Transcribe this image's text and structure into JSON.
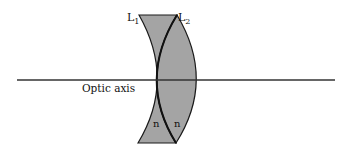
{
  "diagram": {
    "type": "optics-lens-pair",
    "lenses": [
      {
        "id": "L1",
        "label": "L",
        "subscript": "1",
        "index_label": "n"
      },
      {
        "id": "L2",
        "label": "L",
        "subscript": "2",
        "index_label": "n"
      }
    ],
    "axis_label": "Optic axis",
    "colors": {
      "lens_fill": "#a4a4a4",
      "stroke": "#1a1a1a",
      "axis": "#333333"
    }
  }
}
